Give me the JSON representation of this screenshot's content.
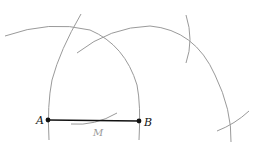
{
  "diagram": {
    "colors": {
      "arc": "#9a9a9a",
      "segment": "#111111",
      "label": "#111111",
      "midpoint_label": "#9a9a9a"
    },
    "points": [
      {
        "id": "A",
        "label": "A",
        "x": 48,
        "y": 120
      },
      {
        "id": "B",
        "label": "B",
        "x": 139,
        "y": 121
      }
    ],
    "midpoint": {
      "label": "M",
      "x": 98,
      "y": 135
    },
    "segment": {
      "from": "A",
      "to": "B"
    }
  }
}
